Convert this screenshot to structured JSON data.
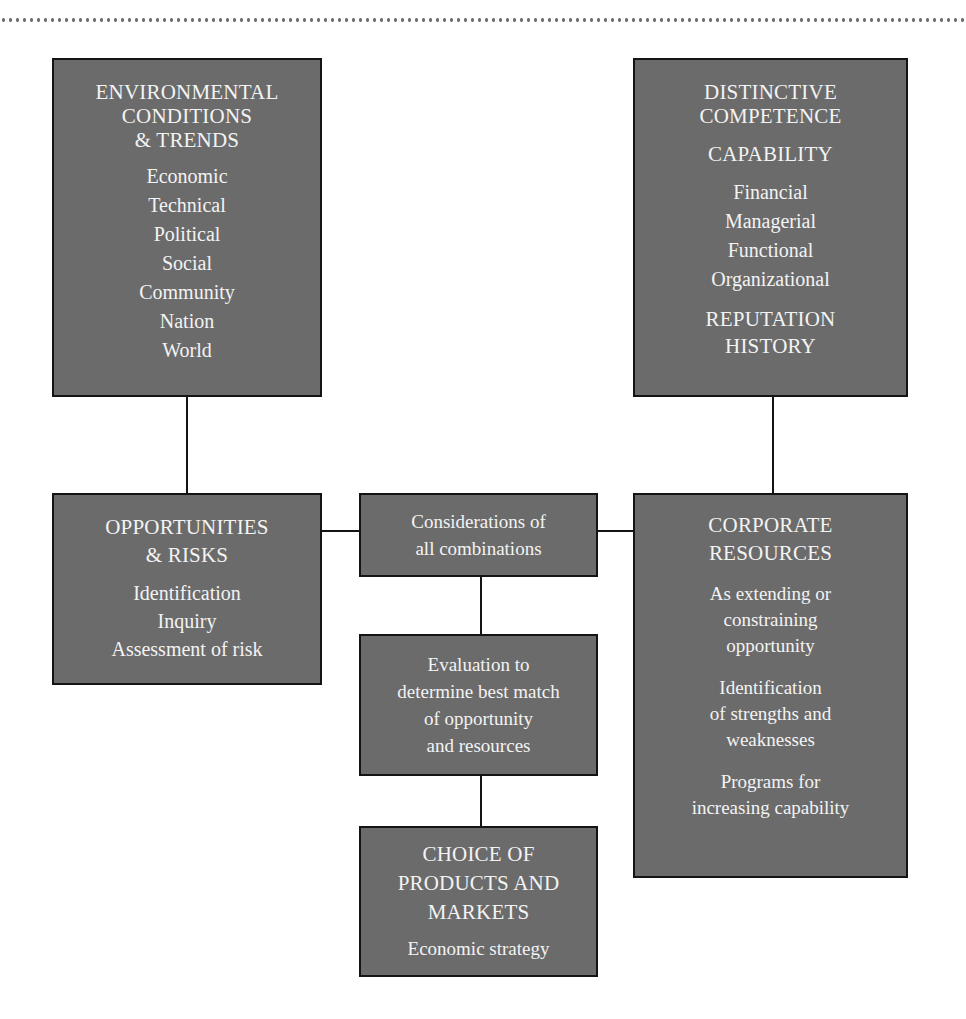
{
  "diagram": {
    "colors": {
      "box_fill": "#6b6b6b",
      "box_border": "#141414",
      "box_text": "#f3f3f3",
      "connector": "#141414",
      "background": "#ffffff",
      "dotted_rule": "#6f6f6f"
    },
    "nodes": {
      "environmental": {
        "heading": "ENVIRONMENTAL\nCONDITIONS\n& TRENDS",
        "items": "Economic\nTechnical\nPolitical\nSocial\nCommunity\nNation\nWorld"
      },
      "distinctive": {
        "heading": "DISTINCTIVE\nCOMPETENCE",
        "subheading": "CAPABILITY",
        "items": "Financial\nManagerial\nFunctional\nOrganizational",
        "footer": "REPUTATION\nHISTORY"
      },
      "opportunities": {
        "heading": "OPPORTUNITIES\n& RISKS",
        "items": "Identification\nInquiry\nAssessment of risk"
      },
      "considerations": {
        "text": "Considerations of\nall combinations"
      },
      "evaluation": {
        "text": "Evaluation to\ndetermine best match\nof opportunity\nand resources"
      },
      "choice": {
        "heading": "CHOICE OF\nPRODUCTS AND\nMARKETS",
        "items": "Economic strategy"
      },
      "corporate": {
        "heading": "CORPORATE\nRESOURCES",
        "para1": "As extending or\nconstraining\nopportunity",
        "para2": "Identification\nof strengths and\nweaknesses",
        "para3": "Programs for\nincreasing capability"
      }
    },
    "edges": [
      {
        "from": "environmental",
        "to": "opportunities"
      },
      {
        "from": "distinctive",
        "to": "corporate"
      },
      {
        "from": "opportunities",
        "to": "considerations"
      },
      {
        "from": "corporate",
        "to": "considerations"
      },
      {
        "from": "considerations",
        "to": "evaluation"
      },
      {
        "from": "evaluation",
        "to": "choice"
      }
    ]
  }
}
